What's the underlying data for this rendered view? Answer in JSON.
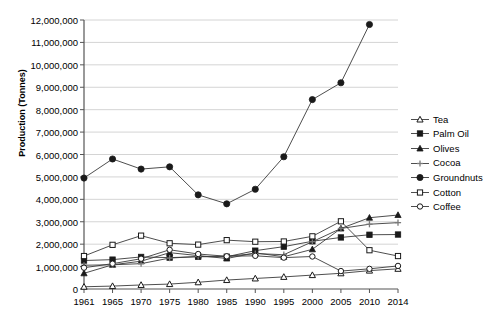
{
  "chart_data": {
    "type": "line",
    "title": "",
    "xlabel": "",
    "ylabel": "Production (Tonnes)",
    "x": [
      1961,
      1965,
      1970,
      1975,
      1980,
      1985,
      1990,
      1995,
      2000,
      2005,
      2010,
      2014
    ],
    "x_ticklabels": [
      "1961",
      "1965",
      "1970",
      "1975",
      "1980",
      "1985",
      "1990",
      "1995",
      "2000",
      "2005",
      "2010",
      "2014"
    ],
    "y_ticklabels": [
      "0",
      "1,000,000",
      "2,000,000",
      "3,000,000",
      "4,000,000",
      "5,000,000",
      "6,000,000",
      "7,000,000",
      "8,000,000",
      "9,000,000",
      "10,000,000",
      "11,000,000",
      "12,000,000"
    ],
    "ylim": [
      0,
      12000000
    ],
    "ytick_step": 1000000,
    "grid": "horizontal",
    "legend_position": "right",
    "series": [
      {
        "name": "Tea",
        "marker": "open-triangle",
        "values": [
          100000,
          130000,
          180000,
          220000,
          300000,
          400000,
          470000,
          540000,
          620000,
          700000,
          820000,
          900000
        ]
      },
      {
        "name": "Palm Oil",
        "marker": "filled-square",
        "values": [
          1270000,
          1310000,
          1430000,
          1400000,
          1440000,
          1440000,
          1710000,
          1890000,
          2130000,
          2300000,
          2420000,
          2430000
        ]
      },
      {
        "name": "Olives",
        "marker": "open-star",
        "values": [
          700000,
          1080000,
          1240000,
          1620000,
          1490000,
          1360000,
          1610000,
          1440000,
          1770000,
          2700000,
          3180000,
          3300000
        ]
      },
      {
        "name": "Cocoa",
        "marker": "cross",
        "values": [
          1060000,
          1080000,
          1130000,
          1380000,
          1450000,
          1460000,
          1580000,
          1530000,
          2110000,
          2700000,
          2890000,
          2960000
        ]
      },
      {
        "name": "Groundnuts",
        "marker": "filled-circle",
        "values": [
          4950000,
          5800000,
          5350000,
          5450000,
          4200000,
          3800000,
          4450000,
          5900000,
          8450000,
          9200000,
          11800000,
          null
        ]
      },
      {
        "name": "Cotton",
        "marker": "open-square",
        "values": [
          1470000,
          1970000,
          2380000,
          2040000,
          1980000,
          2180000,
          2110000,
          2120000,
          2350000,
          3020000,
          1730000,
          1470000
        ]
      },
      {
        "name": "Coffee",
        "marker": "open-circle",
        "values": [
          950000,
          1130000,
          1350000,
          1750000,
          1560000,
          1460000,
          1480000,
          1400000,
          1450000,
          800000,
          900000,
          1030000
        ]
      }
    ]
  },
  "legend": {
    "items": [
      {
        "label": "Tea"
      },
      {
        "label": "Palm Oil"
      },
      {
        "label": "Olives"
      },
      {
        "label": "Cocoa"
      },
      {
        "label": "Groundnuts"
      },
      {
        "label": "Cotton"
      },
      {
        "label": "Coffee"
      }
    ]
  },
  "colors": {
    "line": "#3a3a3a",
    "marker": "#1a1a1a",
    "grid": "#c9c9c9",
    "axis": "#555555",
    "text": "#000000",
    "background": "#ffffff"
  }
}
